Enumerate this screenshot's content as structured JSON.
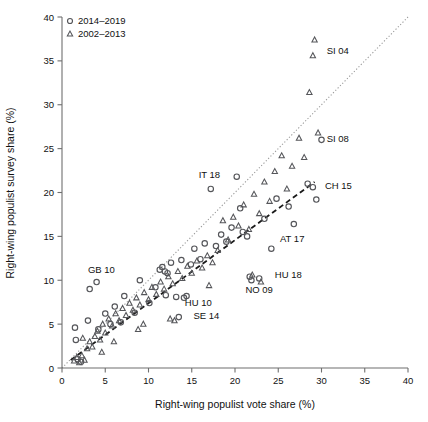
{
  "figure": {
    "background": "#ffffff",
    "marker_color": "#55565a",
    "fit_line_color": "#1a1a1a",
    "ref_line_color": "#9a9a9a"
  },
  "chart_data": {
    "type": "scatter",
    "title": "",
    "xlabel": "Right-wing populist vote share (%)",
    "ylabel": "Right-wing populist survey share (%)",
    "xlim": [
      0,
      40
    ],
    "ylim": [
      0,
      40
    ],
    "xticks": [
      0,
      5,
      10,
      15,
      20,
      25,
      30,
      35,
      40
    ],
    "yticks": [
      0,
      5,
      10,
      15,
      20,
      25,
      30,
      35,
      40
    ],
    "grid": false,
    "legend_position": "top-left",
    "series": [
      {
        "name": "2014-2019",
        "marker": "circle",
        "points": [
          [
            1.6,
            3.2
          ],
          [
            1.8,
            1.0
          ],
          [
            2.2,
            0.7
          ],
          [
            3.2,
            9.0
          ],
          [
            4.0,
            9.8
          ],
          [
            1.5,
            4.6
          ],
          [
            3.0,
            5.4
          ],
          [
            4.2,
            4.4
          ],
          [
            5.6,
            5.0
          ],
          [
            6.8,
            5.2
          ],
          [
            5.0,
            6.2
          ],
          [
            6.1,
            7.0
          ],
          [
            7.2,
            8.2
          ],
          [
            8.4,
            6.3
          ],
          [
            9.0,
            10.0
          ],
          [
            10.1,
            7.4
          ],
          [
            10.8,
            9.2
          ],
          [
            11.3,
            11.2
          ],
          [
            11.6,
            11.5
          ],
          [
            11.9,
            11.0
          ],
          [
            12.2,
            10.8
          ],
          [
            12.0,
            8.3
          ],
          [
            12.6,
            12.0
          ],
          [
            13.2,
            8.1
          ],
          [
            13.5,
            5.8
          ],
          [
            13.8,
            12.3
          ],
          [
            14.1,
            8.0
          ],
          [
            14.4,
            8.2
          ],
          [
            14.9,
            11.8
          ],
          [
            15.3,
            13.6
          ],
          [
            16.0,
            12.4
          ],
          [
            16.5,
            14.2
          ],
          [
            17.2,
            20.4
          ],
          [
            17.8,
            13.9
          ],
          [
            18.4,
            15.2
          ],
          [
            19.0,
            14.4
          ],
          [
            19.6,
            16.0
          ],
          [
            20.2,
            21.8
          ],
          [
            20.6,
            18.2
          ],
          [
            20.9,
            15.5
          ],
          [
            21.4,
            15.0
          ],
          [
            21.7,
            10.4
          ],
          [
            21.9,
            10.0
          ],
          [
            22.8,
            10.2
          ],
          [
            23.4,
            17.0
          ],
          [
            24.2,
            13.6
          ],
          [
            24.8,
            19.3
          ],
          [
            26.2,
            18.4
          ],
          [
            26.8,
            16.4
          ],
          [
            28.4,
            21.0
          ],
          [
            29.0,
            20.6
          ],
          [
            29.4,
            19.2
          ],
          [
            30.0,
            26.0
          ]
        ]
      },
      {
        "name": "2002-2013",
        "marker": "triangle",
        "points": [
          [
            1.4,
            0.8
          ],
          [
            1.7,
            1.2
          ],
          [
            2.0,
            0.6
          ],
          [
            2.3,
            1.4
          ],
          [
            2.6,
            0.9
          ],
          [
            2.9,
            2.2
          ],
          [
            3.2,
            3.0
          ],
          [
            3.5,
            2.4
          ],
          [
            3.8,
            3.6
          ],
          [
            4.1,
            4.2
          ],
          [
            4.4,
            3.2
          ],
          [
            4.7,
            5.0
          ],
          [
            5.0,
            4.0
          ],
          [
            5.4,
            5.6
          ],
          [
            5.8,
            4.8
          ],
          [
            6.2,
            6.2
          ],
          [
            6.6,
            5.4
          ],
          [
            7.0,
            6.8
          ],
          [
            7.4,
            6.0
          ],
          [
            7.8,
            7.4
          ],
          [
            8.2,
            6.6
          ],
          [
            8.6,
            8.0
          ],
          [
            9.0,
            7.2
          ],
          [
            9.5,
            8.6
          ],
          [
            10.0,
            7.8
          ],
          [
            10.4,
            9.2
          ],
          [
            10.9,
            8.4
          ],
          [
            11.4,
            9.8
          ],
          [
            11.8,
            9.0
          ],
          [
            12.3,
            10.4
          ],
          [
            12.8,
            9.6
          ],
          [
            13.4,
            11.0
          ],
          [
            13.9,
            10.2
          ],
          [
            14.5,
            11.6
          ],
          [
            15.0,
            10.8
          ],
          [
            15.6,
            12.2
          ],
          [
            16.2,
            11.4
          ],
          [
            16.8,
            12.8
          ],
          [
            17.4,
            12.0
          ],
          [
            18.0,
            13.4
          ],
          [
            18.6,
            16.8
          ],
          [
            19.2,
            14.6
          ],
          [
            19.8,
            17.2
          ],
          [
            20.4,
            16.2
          ],
          [
            21.0,
            18.6
          ],
          [
            21.6,
            15.8
          ],
          [
            22.2,
            19.8
          ],
          [
            22.8,
            17.6
          ],
          [
            23.4,
            21.2
          ],
          [
            24.0,
            19.0
          ],
          [
            24.6,
            22.4
          ],
          [
            25.4,
            24.2
          ],
          [
            26.0,
            20.4
          ],
          [
            26.6,
            23.0
          ],
          [
            27.4,
            26.2
          ],
          [
            28.0,
            24.0
          ],
          [
            28.6,
            31.4
          ],
          [
            29.0,
            35.6
          ],
          [
            29.2,
            37.4
          ],
          [
            29.6,
            26.8
          ],
          [
            22.0,
            10.6
          ],
          [
            23.0,
            9.8
          ],
          [
            12.5,
            5.6
          ],
          [
            13.0,
            5.4
          ],
          [
            6.0,
            3.0
          ],
          [
            4.6,
            1.8
          ],
          [
            2.4,
            3.4
          ],
          [
            8.8,
            4.4
          ],
          [
            9.4,
            5.0
          ],
          [
            17.0,
            9.4
          ]
        ]
      }
    ],
    "reference_line": {
      "name": "identity-line",
      "style": "dotted",
      "from": [
        0,
        0
      ],
      "to": [
        40,
        40
      ]
    },
    "fit_line": {
      "name": "regression-line",
      "style": "dashed",
      "from": [
        1.0,
        0.9
      ],
      "to": [
        29.2,
        21.2
      ]
    },
    "annotations": [
      {
        "text": "GB 10",
        "x": 3.0,
        "y": 10.8
      },
      {
        "text": "SE 14",
        "x": 15.2,
        "y": 5.6
      },
      {
        "text": "HU 10",
        "x": 14.2,
        "y": 7.1
      },
      {
        "text": "IT 18",
        "x": 15.8,
        "y": 21.6
      },
      {
        "text": "NO 09",
        "x": 21.2,
        "y": 8.6
      },
      {
        "text": "HU 18",
        "x": 24.6,
        "y": 10.2
      },
      {
        "text": "AT 17",
        "x": 25.2,
        "y": 14.4
      },
      {
        "text": "CH 15",
        "x": 30.4,
        "y": 20.4
      },
      {
        "text": "SI 08",
        "x": 30.6,
        "y": 25.8
      },
      {
        "text": "SI 04",
        "x": 30.6,
        "y": 35.8
      }
    ]
  },
  "legend": {
    "items": [
      {
        "marker": "circle",
        "label": "2014–2019"
      },
      {
        "marker": "triangle",
        "label": "2002–2013"
      }
    ]
  }
}
